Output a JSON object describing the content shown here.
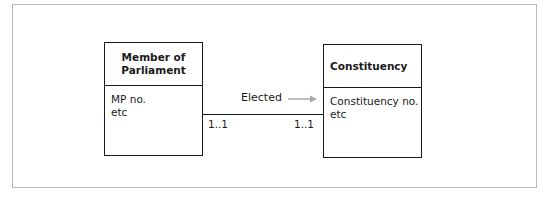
{
  "diagram": {
    "type": "entity-relationship",
    "entities": [
      {
        "name": "Member of\nParliament",
        "attributes": [
          "MP no.",
          "etc"
        ]
      },
      {
        "name": "Constituency",
        "attributes": [
          "Constituency no.",
          "etc"
        ]
      }
    ],
    "relationship": {
      "label": "Elected",
      "direction_icon": "right-arrow-icon",
      "arrow_color": "#a8a8a8",
      "cardinality_left": "1..1",
      "cardinality_right": "1..1"
    }
  }
}
